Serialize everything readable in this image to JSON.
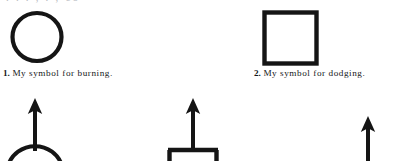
{
  "page": {
    "width": 396,
    "height": 161,
    "background": "#ffffff",
    "ink_color": "#151515",
    "clipped_top_line": ". .      .      ,      .           ,      co"
  },
  "figures": [
    {
      "id": "figure-1",
      "shape": "circle",
      "caption_number": "1.",
      "caption_text": "My symbol for burning.",
      "full_caption": "1. My symbol for burning."
    },
    {
      "id": "figure-2",
      "shape": "square",
      "caption_number": "2.",
      "caption_text": "My symbol for dodging.",
      "full_caption": "2. My symbol for dodging."
    }
  ],
  "bottom_row": {
    "description": "Partially visible next row of symbols, clipped by the bottom edge of the page",
    "items": [
      {
        "id": "figure-3-partial",
        "shape": "circle-with-up-arrow",
        "arrow_direction": "up"
      },
      {
        "id": "figure-4-partial",
        "shape": "square-with-up-arrow",
        "arrow_direction": "up"
      },
      {
        "id": "figure-5-partial",
        "shape": "up-arrow",
        "arrow_direction": "up"
      }
    ]
  }
}
